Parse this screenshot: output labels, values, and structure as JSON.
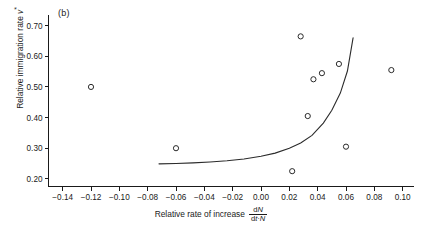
{
  "panel": {
    "label": "(b)"
  },
  "axes": {
    "x_title_prefix": "Relative rate of increase",
    "x_frac_numerator": "dN",
    "x_frac_denominator": "dt·N",
    "y_title": "Relative immigration rate v*",
    "x_ticks": [
      "-0.14",
      "-0.12",
      "-0.10",
      "-0.08",
      "-0.06",
      "-0.04",
      "-0.02",
      "0.00",
      "0.02",
      "0.04",
      "0.06",
      "0.08",
      "0.10"
    ],
    "y_ticks": [
      "0.70",
      "0.60",
      "0.50",
      "0.40",
      "0.30",
      "0.20"
    ]
  },
  "chart_data": {
    "type": "scatter",
    "title": "(b)",
    "xlabel": "Relative rate of increase dN/(dt·N)",
    "ylabel": "Relative immigration rate v*",
    "xlim": [
      -0.15,
      0.108
    ],
    "ylim": [
      0.175,
      0.725
    ],
    "xticks": [
      -0.14,
      -0.12,
      -0.1,
      -0.08,
      -0.06,
      -0.04,
      -0.02,
      0.0,
      0.02,
      0.04,
      0.06,
      0.08,
      0.1
    ],
    "yticks": [
      0.2,
      0.3,
      0.4,
      0.5,
      0.6,
      0.7
    ],
    "grid": false,
    "legend": "none",
    "marker": "open-circle",
    "points": [
      {
        "x": -0.12,
        "y": 0.5
      },
      {
        "x": -0.06,
        "y": 0.3
      },
      {
        "x": 0.022,
        "y": 0.225
      },
      {
        "x": 0.028,
        "y": 0.665
      },
      {
        "x": 0.033,
        "y": 0.405
      },
      {
        "x": 0.037,
        "y": 0.525
      },
      {
        "x": 0.043,
        "y": 0.545
      },
      {
        "x": 0.055,
        "y": 0.575
      },
      {
        "x": 0.06,
        "y": 0.305
      },
      {
        "x": 0.092,
        "y": 0.555
      }
    ],
    "series": [
      {
        "name": "fitted curve",
        "type": "line",
        "x": [
          -0.072,
          -0.06,
          -0.048,
          -0.036,
          -0.024,
          -0.012,
          0.0,
          0.01,
          0.02,
          0.028,
          0.036,
          0.044,
          0.05,
          0.056,
          0.061,
          0.065
        ],
        "y": [
          0.249,
          0.25,
          0.252,
          0.255,
          0.259,
          0.265,
          0.274,
          0.284,
          0.3,
          0.317,
          0.342,
          0.382,
          0.424,
          0.48,
          0.552,
          0.66
        ]
      }
    ],
    "colors": {
      "marker_stroke": "#2b2b2b",
      "curve": "#2b2b2b",
      "axis": "#1a1a1a"
    }
  }
}
